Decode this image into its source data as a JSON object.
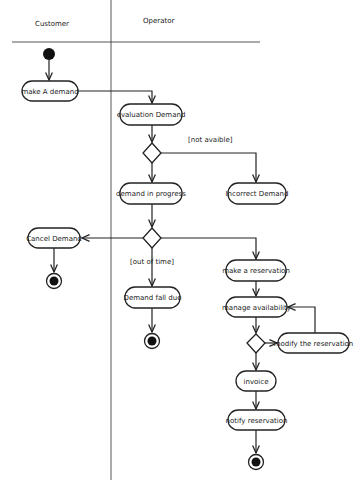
{
  "diagram": {
    "type": "uml-activity",
    "swimlanes": [
      {
        "id": "customer",
        "label": "Customer"
      },
      {
        "id": "operator",
        "label": "Operator"
      }
    ],
    "nodes": {
      "make_demand": {
        "label": "make A demand",
        "lane": "customer"
      },
      "evaluation_demand": {
        "label": "evaluation Demand",
        "lane": "operator"
      },
      "demand_in_progress": {
        "label": "demand in progress",
        "lane": "operator"
      },
      "incorrect_demand": {
        "label": "Incorrect Demand",
        "lane": "operator"
      },
      "cancel_demand": {
        "label": "Cancel Demand",
        "lane": "customer"
      },
      "demand_fall_due": {
        "label": "Demand fall due",
        "lane": "operator"
      },
      "make_reservation": {
        "label": "make a reservation",
        "lane": "operator"
      },
      "manage_availability": {
        "label": "manage availability",
        "lane": "operator"
      },
      "modify_reservation": {
        "label": "modify the reservation",
        "lane": "operator"
      },
      "invoice": {
        "label": "invoice",
        "lane": "operator"
      },
      "notify_reservation": {
        "label": "notify reservation",
        "lane": "operator"
      }
    },
    "guards": {
      "not_available": "[not avaible]",
      "out_of_time": "[out of time]"
    },
    "edges": [
      {
        "from": "initial",
        "to": "make_demand"
      },
      {
        "from": "make_demand",
        "to": "evaluation_demand"
      },
      {
        "from": "evaluation_demand",
        "to": "decision_1"
      },
      {
        "from": "decision_1",
        "to": "incorrect_demand",
        "guard": "[not avaible]"
      },
      {
        "from": "decision_1",
        "to": "demand_in_progress"
      },
      {
        "from": "demand_in_progress",
        "to": "decision_2"
      },
      {
        "from": "decision_2",
        "to": "cancel_demand"
      },
      {
        "from": "cancel_demand",
        "to": "final_customer"
      },
      {
        "from": "decision_2",
        "to": "demand_fall_due",
        "guard": "[out of time]"
      },
      {
        "from": "demand_fall_due",
        "to": "final_fall_due"
      },
      {
        "from": "decision_2",
        "to": "make_reservation"
      },
      {
        "from": "make_reservation",
        "to": "manage_availability"
      },
      {
        "from": "manage_availability",
        "to": "decision_3"
      },
      {
        "from": "decision_3",
        "to": "modify_reservation"
      },
      {
        "from": "modify_reservation",
        "to": "manage_availability"
      },
      {
        "from": "decision_3",
        "to": "invoice"
      },
      {
        "from": "invoice",
        "to": "notify_reservation"
      },
      {
        "from": "notify_reservation",
        "to": "final_operator"
      }
    ],
    "colors": {
      "stroke": "#222222",
      "background": "#ffffff"
    }
  }
}
